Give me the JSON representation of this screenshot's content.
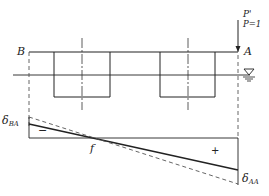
{
  "diagram": {
    "type": "influence-line",
    "labels": {
      "left_node": "B",
      "right_node": "A",
      "load_name": "P'",
      "load_value": "P=1",
      "zero_point": "f",
      "delta_left_main": "δ",
      "delta_left_sub": "BA",
      "delta_right_main": "δ",
      "delta_right_sub": "AA",
      "negative_sign": "−",
      "positive_sign": "+"
    },
    "symbols": {
      "water_level": "water-level-triangle"
    },
    "colors": {
      "line": "#222222",
      "dashed": "#555555",
      "background": "#ffffff"
    }
  }
}
